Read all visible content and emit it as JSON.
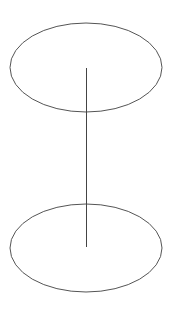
{
  "figure": {
    "background_color": "#ffffff",
    "stroke_color": "#555555",
    "axis_color": "#444444",
    "width": 172,
    "height": 312,
    "shapes": [
      {
        "name": "top-ellipse",
        "type": "ellipse",
        "cx": 86,
        "cy": 67.5,
        "rx": 76,
        "ry": 44.5,
        "stroke": "#555555",
        "stroke_width": 1,
        "fill": "none"
      },
      {
        "name": "bottom-ellipse",
        "type": "ellipse",
        "cx": 86,
        "cy": 248,
        "rx": 76,
        "ry": 44,
        "stroke": "#555555",
        "stroke_width": 1,
        "fill": "none"
      },
      {
        "name": "vertical-axis-line",
        "type": "line",
        "x1": 86.5,
        "y1": 68,
        "x2": 86.5,
        "y2": 247,
        "stroke": "#444444",
        "stroke_width": 1.1
      }
    ]
  }
}
